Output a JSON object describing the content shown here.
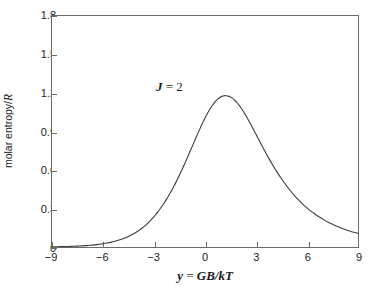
{
  "chart_data": {
    "type": "line",
    "title": "",
    "xlabel": "y = GB/kT",
    "xlabel_parts": {
      "symbol": "y",
      "equals": " = ",
      "expr": "GB/kT"
    },
    "ylabel": "molar entropy/R",
    "ylabel_parts": {
      "text": "molar entropy/",
      "symbol": "R"
    },
    "xlim": [
      -9,
      9
    ],
    "ylim": [
      0,
      1.8
    ],
    "grid": false,
    "legend": "none",
    "annotations": [
      {
        "name": "J = 2",
        "symbol": "J",
        "equals": " = ",
        "value": "2",
        "x": -5.0,
        "y": 1.38
      }
    ],
    "xticks": [
      -9,
      -6,
      -3,
      0,
      3,
      6,
      9
    ],
    "xtick_labels": [
      "−9",
      "−6",
      "−3",
      "0",
      "3",
      "6",
      "9"
    ],
    "yticks": [
      0,
      0.3,
      0.6,
      0.9,
      1.2,
      1.5,
      1.8
    ],
    "ytick_labels": [
      "0",
      "0.3",
      "0.6",
      "0.9",
      "1.2",
      "1.5",
      "1.8"
    ],
    "series": [
      {
        "name": "molar entropy/R for J = 2",
        "color": "#3c3c3c",
        "linewidth": 1.1,
        "peak_x": 0,
        "peak_y": 1.609,
        "x": [
          -9.0,
          -8.75,
          -8.5,
          -8.25,
          -8.0,
          -7.75,
          -7.5,
          -7.25,
          -7.0,
          -6.75,
          -6.5,
          -6.25,
          -6.0,
          -5.75,
          -5.5,
          -5.25,
          -5.0,
          -4.75,
          -4.5,
          -4.25,
          -4.0,
          -3.75,
          -3.5,
          -3.25,
          -3.0,
          -2.875,
          -2.75,
          -2.625,
          -2.5,
          -2.375,
          -2.25,
          -2.125,
          -2.0,
          -1.875,
          -1.75,
          -1.625,
          -1.5,
          -1.375,
          -1.25,
          -1.125,
          -1.0,
          -0.875,
          -0.75,
          -0.625,
          -0.5,
          -0.375,
          -0.25,
          -0.125,
          0.0,
          0.125,
          0.25,
          0.375,
          0.5,
          0.625,
          0.75,
          0.875,
          1.0,
          1.125,
          1.25,
          1.375,
          1.5,
          1.625,
          1.75,
          1.875,
          2.0,
          2.125,
          2.25,
          2.375,
          2.5,
          2.625,
          2.75,
          2.875,
          3.0,
          3.25,
          3.5,
          3.75,
          4.0,
          4.25,
          4.5,
          4.75,
          5.0,
          5.25,
          5.5,
          5.75,
          6.0,
          6.25,
          6.5,
          6.75,
          7.0,
          7.25,
          7.5,
          7.75,
          8.0,
          8.25,
          8.5,
          8.75,
          9.0
        ],
        "y": [
          0.0018,
          0.0023,
          0.0029,
          0.0036,
          0.0045,
          0.0057,
          0.0071,
          0.0088,
          0.0109,
          0.0135,
          0.0167,
          0.0206,
          0.0253,
          0.031,
          0.0379,
          0.0462,
          0.0562,
          0.0681,
          0.0823,
          0.0991,
          0.1189,
          0.1421,
          0.1691,
          0.2004,
          0.2363,
          0.2561,
          0.2772,
          0.2996,
          0.3233,
          0.3484,
          0.3748,
          0.4026,
          0.4317,
          0.4621,
          0.4938,
          0.5268,
          0.5609,
          0.5962,
          0.6324,
          0.6695,
          0.7073,
          0.7456,
          0.7842,
          0.8228,
          0.8612,
          0.8989,
          0.9357,
          0.9711,
          1.0049,
          1.0366,
          1.0659,
          1.0924,
          1.1158,
          1.1359,
          1.1523,
          1.1649,
          1.1736,
          1.1783,
          1.179,
          1.1757,
          1.1686,
          1.1578,
          1.1435,
          1.126,
          1.1056,
          1.0826,
          1.0574,
          1.0302,
          1.0015,
          0.9716,
          0.9408,
          0.9095,
          0.8779,
          0.8146,
          0.7525,
          0.6925,
          0.6354,
          0.5816,
          0.5314,
          0.4849,
          0.4421,
          0.4029,
          0.367,
          0.3344,
          0.3047,
          0.2778,
          0.2534,
          0.2313,
          0.2113,
          0.1932,
          0.1768,
          0.162,
          0.1486,
          0.1364,
          0.1254,
          0.1154,
          0.1063
        ]
      }
    ]
  },
  "figure": {
    "background": "#ffffff",
    "frame_color": "#6a6a6a",
    "text_color": "#1a1a1a"
  }
}
